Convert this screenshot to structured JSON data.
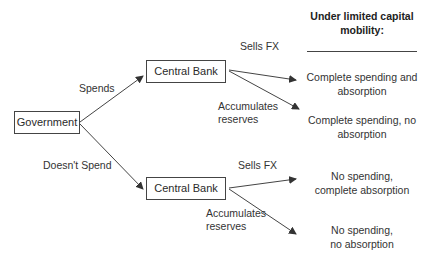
{
  "nodes": {
    "government": "Government",
    "central_bank_top": "Central Bank",
    "central_bank_bottom": "Central Bank"
  },
  "edges": {
    "spends": "Spends",
    "doesnt_spend": "Doesn't Spend",
    "sells_fx_top": "Sells FX",
    "accumulates_top": [
      "Accumulates",
      "reserves"
    ],
    "sells_fx_bottom": "Sells FX",
    "accumulates_bottom": [
      "Accumulates",
      "reserves"
    ]
  },
  "header": {
    "title_lines": [
      "Under limited  capital",
      "mobility:"
    ]
  },
  "outcomes": [
    {
      "lines": [
        "Complete spending and",
        "absorption"
      ]
    },
    {
      "lines": [
        "Complete spending, no",
        "absorption"
      ]
    },
    {
      "lines": [
        "No spending,",
        "complete absorption"
      ]
    },
    {
      "lines": [
        "No spending,",
        "no absorption"
      ]
    }
  ],
  "colors": {
    "line": "#444444",
    "text": "#333333",
    "background": "#ffffff"
  }
}
